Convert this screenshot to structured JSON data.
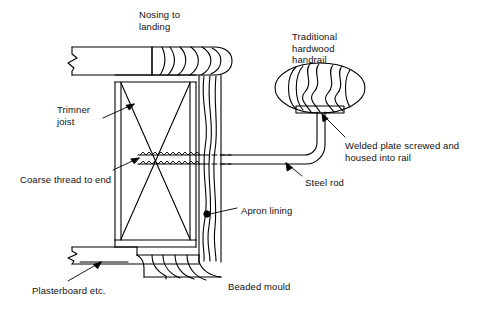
{
  "diagram": {
    "type": "construction-section-drawing",
    "stroke_color": "#000000",
    "background_color": "#ffffff",
    "labels": [
      {
        "id": "nosing",
        "text_lines": [
          "Nosing to",
          "landing"
        ],
        "x": 139,
        "y": 10
      },
      {
        "id": "handrail",
        "text_lines": [
          "Traditional",
          "hardwood",
          "handrail"
        ],
        "x": 292,
        "y": 32
      },
      {
        "id": "trimmer-joist",
        "text_lines": [
          "Trimner",
          "joist"
        ],
        "x": 60,
        "y": 105
      },
      {
        "id": "welded-plate",
        "text_lines": [
          "Welded plate screwed and",
          "housed into rail"
        ],
        "x": 345,
        "y": 141
      },
      {
        "id": "coarse-thread",
        "text_lines": [
          "Coarse thread to end"
        ],
        "x": 22,
        "y": 175
      },
      {
        "id": "steel-rod",
        "text_lines": [
          "Steel rod"
        ],
        "x": 305,
        "y": 178
      },
      {
        "id": "apron-lining",
        "text_lines": [
          "Apron lining"
        ],
        "x": 240,
        "y": 206
      },
      {
        "id": "plasterboard",
        "text_lines": [
          "Plasterboard etc."
        ],
        "x": 33,
        "y": 286
      },
      {
        "id": "beaded-mould",
        "text_lines": [
          "Beaded mould"
        ],
        "x": 228,
        "y": 282
      }
    ],
    "components": [
      {
        "name": "landing-floor-board",
        "description": "horizontal landing boards with break symbol at left"
      },
      {
        "name": "bullnose-nosing",
        "description": "rounded bullnose end with wood grain arcs"
      },
      {
        "name": "trimmer-joist",
        "description": "tall rectangle with X cross bracing"
      },
      {
        "name": "apron-lining",
        "description": "vertical board with wavy grain"
      },
      {
        "name": "steel-rod",
        "description": "double line rod with coarse thread and upturned end"
      },
      {
        "name": "handrail",
        "description": "ellipse with wavy grain lines"
      },
      {
        "name": "welded-plate",
        "description": "flat plate at underside of handrail"
      },
      {
        "name": "beaded-mould",
        "description": "scalloped moulding at ceiling line"
      },
      {
        "name": "plasterboard",
        "description": "horizontal ceiling board with break symbol"
      }
    ]
  }
}
